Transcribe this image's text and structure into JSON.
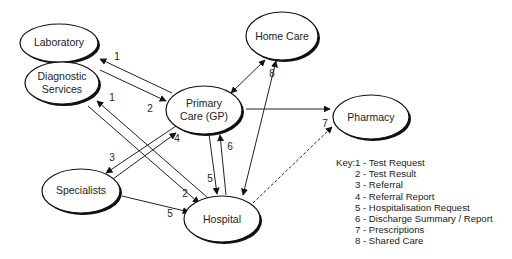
{
  "nodes": {
    "laboratory": "Laboratory",
    "diagnostic_line1": "Diagnostic",
    "diagnostic_line2": "Services",
    "home_care": "Home Care",
    "primary_line1": "Primary",
    "primary_line2": "Care (GP)",
    "pharmacy": "Pharmacy",
    "specialists": "Specialists",
    "hospital": "Hospital"
  },
  "edge_labels": {
    "lab_gp_request": "1",
    "lab_gp_result": "2",
    "diag_hosp_request": "1",
    "diag_hosp_result": "2",
    "gp_spec_referral": "3",
    "spec_gp_report": "4",
    "gp_hosp_request": "5",
    "hosp_gp_discharge": "6",
    "spec_hosp_request": "5",
    "gp_pharmacy": "7",
    "homecare_shared": "8"
  },
  "key": {
    "title": "Key:",
    "items": [
      "1 - Test Request",
      "2 - Test Result",
      "3 - Referral",
      "4 - Referral Report",
      "5 - Hospitalisation Request",
      "6 - Discharge Summary / Report",
      "7 - Prescriptions",
      "8 - Shared Care"
    ]
  }
}
